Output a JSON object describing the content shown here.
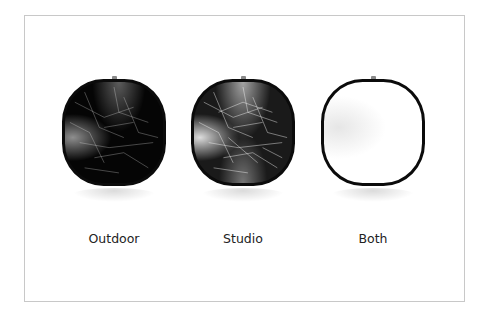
{
  "items": [
    {
      "label": "Outdoor",
      "variant": "dark"
    },
    {
      "label": "Studio",
      "variant": "silver"
    },
    {
      "label": "Both",
      "variant": "white"
    }
  ],
  "colors": {
    "frame_border": "#c8c8c8",
    "reflector_rim": "#0b0b0b",
    "label_text": "#222222"
  }
}
